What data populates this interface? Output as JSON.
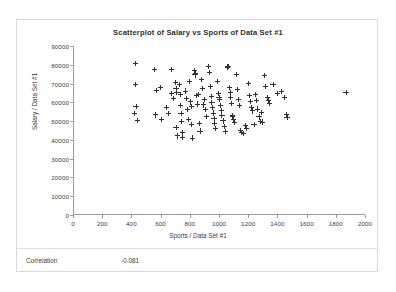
{
  "chart_data": {
    "type": "scatter",
    "title": "Scatterplot of Salary vs Sports of Data Set #1",
    "xlabel": "Sports / Data Set #1",
    "ylabel": "Salary / Data Set #1",
    "xlim": [
      0,
      2000
    ],
    "ylim": [
      0,
      90000
    ],
    "xticks": [
      0,
      200,
      400,
      600,
      800,
      1000,
      1200,
      1400,
      1600,
      1800,
      2000
    ],
    "yticks": [
      0,
      10000,
      20000,
      30000,
      40000,
      50000,
      60000,
      70000,
      80000,
      90000
    ],
    "xtick_labels": [
      "0",
      "200",
      "400",
      "600",
      "800",
      "1000",
      "1200",
      "1400",
      "1600",
      "1800",
      "2000"
    ],
    "ytick_labels": [
      "0",
      "10000",
      "20000",
      "30000",
      "40000",
      "50000",
      "60000",
      "70000",
      "80000",
      "90000"
    ],
    "grid": false,
    "legend": false,
    "marker": "plus",
    "marker_color": "#303030",
    "series": [
      {
        "name": "Data Set #1",
        "points": [
          [
            430,
            80500
          ],
          [
            428,
            69700
          ],
          [
            432,
            57800
          ],
          [
            424,
            54100
          ],
          [
            440,
            50300
          ],
          [
            560,
            77400
          ],
          [
            574,
            66200
          ],
          [
            566,
            53300
          ],
          [
            600,
            67900
          ],
          [
            604,
            51000
          ],
          [
            640,
            57200
          ],
          [
            652,
            54000
          ],
          [
            672,
            77600
          ],
          [
            676,
            64800
          ],
          [
            690,
            61900
          ],
          [
            700,
            70600
          ],
          [
            706,
            67200
          ],
          [
            712,
            65500
          ],
          [
            706,
            46600
          ],
          [
            716,
            42100
          ],
          [
            730,
            69300
          ],
          [
            734,
            64300
          ],
          [
            736,
            58200
          ],
          [
            740,
            53900
          ],
          [
            744,
            49700
          ],
          [
            748,
            44100
          ],
          [
            752,
            41400
          ],
          [
            770,
            66000
          ],
          [
            778,
            62100
          ],
          [
            786,
            56300
          ],
          [
            790,
            50900
          ],
          [
            800,
            71100
          ],
          [
            806,
            60200
          ],
          [
            812,
            57900
          ],
          [
            814,
            48400
          ],
          [
            818,
            41000
          ],
          [
            830,
            76900
          ],
          [
            836,
            74600
          ],
          [
            840,
            75300
          ],
          [
            846,
            63500
          ],
          [
            852,
            59100
          ],
          [
            858,
            64100
          ],
          [
            864,
            48900
          ],
          [
            870,
            44700
          ],
          [
            880,
            72200
          ],
          [
            886,
            67400
          ],
          [
            892,
            58600
          ],
          [
            900,
            61300
          ],
          [
            906,
            56000
          ],
          [
            912,
            52400
          ],
          [
            930,
            79100
          ],
          [
            936,
            75800
          ],
          [
            942,
            68300
          ],
          [
            948,
            63000
          ],
          [
            952,
            59700
          ],
          [
            956,
            57100
          ],
          [
            960,
            54300
          ],
          [
            966,
            51200
          ],
          [
            970,
            48600
          ],
          [
            978,
            45900
          ],
          [
            990,
            70900
          ],
          [
            996,
            64600
          ],
          [
            1000,
            62700
          ],
          [
            1004,
            61400
          ],
          [
            1010,
            58100
          ],
          [
            1016,
            55600
          ],
          [
            1020,
            52900
          ],
          [
            1028,
            50100
          ],
          [
            1036,
            47200
          ],
          [
            1044,
            44300
          ],
          [
            1056,
            78800
          ],
          [
            1062,
            78900
          ],
          [
            1070,
            68100
          ],
          [
            1076,
            65100
          ],
          [
            1080,
            62400
          ],
          [
            1086,
            59400
          ],
          [
            1090,
            53100
          ],
          [
            1094,
            52700
          ],
          [
            1100,
            50600
          ],
          [
            1108,
            49300
          ],
          [
            1120,
            74800
          ],
          [
            1126,
            66700
          ],
          [
            1132,
            61700
          ],
          [
            1140,
            58400
          ],
          [
            1148,
            44900
          ],
          [
            1156,
            43800
          ],
          [
            1170,
            43600
          ],
          [
            1180,
            47800
          ],
          [
            1190,
            46300
          ],
          [
            1200,
            70000
          ],
          [
            1210,
            63800
          ],
          [
            1216,
            60300
          ],
          [
            1224,
            57000
          ],
          [
            1232,
            55400
          ],
          [
            1240,
            48200
          ],
          [
            1250,
            64200
          ],
          [
            1258,
            61000
          ],
          [
            1266,
            56400
          ],
          [
            1274,
            52200
          ],
          [
            1282,
            50000
          ],
          [
            1290,
            54600
          ],
          [
            1296,
            49500
          ],
          [
            1310,
            74100
          ],
          [
            1320,
            68500
          ],
          [
            1330,
            62600
          ],
          [
            1340,
            60800
          ],
          [
            1348,
            59200
          ],
          [
            1370,
            69600
          ],
          [
            1400,
            64500
          ],
          [
            1430,
            65900
          ],
          [
            1450,
            62500
          ],
          [
            1460,
            53600
          ],
          [
            1466,
            52000
          ],
          [
            1870,
            65300
          ]
        ]
      }
    ],
    "annotations": {
      "correlation_label": "Correlation",
      "correlation_value": "-0.081"
    }
  },
  "footer": {
    "correlation_label": "Correlation",
    "correlation_value": "-0.081"
  }
}
